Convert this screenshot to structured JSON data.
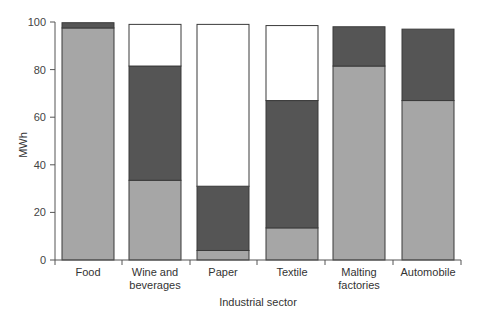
{
  "chart_data": {
    "type": "bar",
    "stacked": true,
    "title": "",
    "xlabel": "Industrial sector",
    "ylabel": "MWh",
    "ylim": [
      0,
      100
    ],
    "yticks": [
      0,
      20,
      40,
      60,
      80,
      100
    ],
    "grid": false,
    "legend": null,
    "categories": [
      "Food",
      "Wine and beverages",
      "Paper",
      "Textile",
      "Malting factories",
      "Automobile"
    ],
    "category_lines": [
      [
        "Food"
      ],
      [
        "Wine and",
        "beverages"
      ],
      [
        "Paper"
      ],
      [
        "Textile"
      ],
      [
        "Malting",
        "factories"
      ],
      [
        "Automobile"
      ]
    ],
    "series": [
      {
        "name": "bottom (light gray)",
        "color": "#a6a6a6",
        "values": [
          97.5,
          33.5,
          4,
          13.5,
          81.5,
          67
        ]
      },
      {
        "name": "middle (dark gray)",
        "color": "#555555",
        "values": [
          2.2,
          48,
          27,
          53.5,
          16.5,
          30
        ]
      },
      {
        "name": "top (white)",
        "color": "#ffffff",
        "values": [
          0,
          17.5,
          68,
          31.5,
          0,
          0
        ]
      }
    ]
  }
}
